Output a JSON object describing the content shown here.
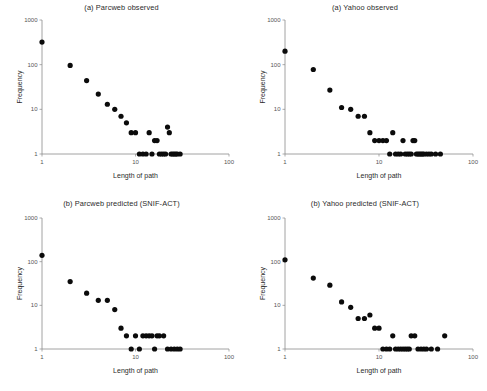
{
  "figure": {
    "background": "#ffffff",
    "marker_color": "#0b0b0b",
    "axis_color": "#8a8a8a"
  },
  "axes_common": {
    "xlabel": "Length of path",
    "ylabel": "Frequency",
    "x_ticks": [
      "1",
      "10",
      "100"
    ],
    "y_ticks": [
      "1",
      "10",
      "100",
      "1000"
    ],
    "xlim": [
      1,
      100
    ],
    "ylim": [
      1,
      1000
    ],
    "xscale": "log",
    "yscale": "log",
    "grid": "off",
    "legend": "none"
  },
  "panels": [
    {
      "id": "parcweb-observed",
      "title": "(a) Parcweb observed"
    },
    {
      "id": "yahoo-observed",
      "title": "(a) Yahoo observed"
    },
    {
      "id": "parcweb-predicted",
      "title": "(b) Parcweb predicted (SNIF-ACT)"
    },
    {
      "id": "yahoo-predicted",
      "title": "(b) Yahoo predicted (SNIF-ACT)"
    }
  ],
  "chart_data": [
    {
      "type": "scatter",
      "title": "(a) Parcweb observed",
      "xlabel": "Length of path",
      "ylabel": "Frequency",
      "xscale": "log",
      "yscale": "log",
      "xlim": [
        1,
        100
      ],
      "ylim": [
        1,
        1000
      ],
      "x_ticks": [
        1,
        10,
        100
      ],
      "y_ticks": [
        1,
        10,
        100,
        1000
      ],
      "grid": false,
      "legend": null,
      "x": [
        1,
        2,
        3,
        4,
        5,
        6,
        7,
        8,
        9,
        10,
        11,
        12,
        13,
        14,
        15,
        16,
        17,
        18,
        19,
        20,
        21,
        22,
        23,
        24,
        25,
        26,
        27,
        28,
        30
      ],
      "y": [
        320,
        96,
        44,
        22,
        13,
        10,
        7,
        5,
        3,
        3,
        1,
        1,
        1,
        3,
        1,
        2,
        2,
        1,
        1,
        1,
        1,
        4,
        3,
        1,
        1,
        1,
        1,
        1,
        1
      ]
    },
    {
      "type": "scatter",
      "title": "(a) Yahoo observed",
      "xlabel": "Length of path",
      "ylabel": "Frequency",
      "xscale": "log",
      "yscale": "log",
      "xlim": [
        1,
        100
      ],
      "ylim": [
        1,
        1000
      ],
      "x_ticks": [
        1,
        10,
        100
      ],
      "y_ticks": [
        1,
        10,
        100,
        1000
      ],
      "grid": false,
      "legend": null,
      "x": [
        1,
        2,
        3,
        4,
        5,
        6,
        7,
        8,
        9,
        10,
        11,
        12,
        13,
        14,
        15,
        16,
        17,
        18,
        19,
        20,
        21,
        22,
        23,
        24,
        25,
        26,
        27,
        28,
        29,
        30,
        32,
        34,
        36,
        40,
        45
      ],
      "y": [
        200,
        78,
        27,
        11,
        10,
        7,
        7,
        3,
        2,
        2,
        2,
        2,
        1,
        3,
        1,
        1,
        1,
        2,
        1,
        1,
        1,
        1,
        2,
        2,
        1,
        1,
        1,
        1,
        1,
        1,
        1,
        1,
        1,
        1,
        1
      ]
    },
    {
      "type": "scatter",
      "title": "(b) Parcweb predicted (SNIF-ACT)",
      "xlabel": "Length of path",
      "ylabel": "Frequency",
      "xscale": "log",
      "yscale": "log",
      "xlim": [
        1,
        100
      ],
      "ylim": [
        1,
        1000
      ],
      "x_ticks": [
        1,
        10,
        100
      ],
      "y_ticks": [
        1,
        10,
        100,
        1000
      ],
      "grid": false,
      "legend": null,
      "x": [
        1,
        2,
        3,
        4,
        5,
        6,
        7,
        8,
        9,
        10,
        11,
        12,
        13,
        14,
        15,
        16,
        17,
        18,
        20,
        22,
        24,
        26,
        28,
        30
      ],
      "y": [
        140,
        35,
        19,
        13,
        13,
        8,
        3,
        2,
        1,
        2,
        1,
        2,
        2,
        2,
        2,
        1,
        2,
        2,
        2,
        1,
        1,
        1,
        1,
        1
      ]
    },
    {
      "type": "scatter",
      "title": "(b) Yahoo predicted (SNIF-ACT)",
      "xlabel": "Length of path",
      "ylabel": "Frequency",
      "xscale": "log",
      "yscale": "log",
      "xlim": [
        1,
        100
      ],
      "ylim": [
        1,
        1000
      ],
      "x_ticks": [
        1,
        10,
        100
      ],
      "y_ticks": [
        1,
        10,
        100,
        1000
      ],
      "grid": false,
      "legend": null,
      "x": [
        1,
        2,
        3,
        4,
        5,
        6,
        7,
        8,
        9,
        10,
        11,
        12,
        13,
        14,
        15,
        16,
        17,
        18,
        19,
        20,
        21,
        22,
        24,
        26,
        28,
        30,
        32,
        36,
        42,
        50
      ],
      "y": [
        110,
        42,
        29,
        12,
        9,
        5,
        5,
        6,
        3,
        3,
        1,
        1,
        1,
        2,
        1,
        1,
        1,
        1,
        1,
        1,
        1,
        2,
        2,
        1,
        1,
        1,
        1,
        1,
        1,
        2
      ]
    }
  ]
}
